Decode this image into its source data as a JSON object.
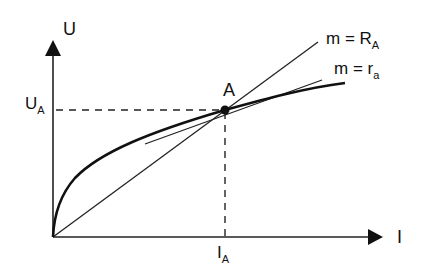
{
  "diagram": {
    "y_axis_label": "U",
    "x_axis_label": "I",
    "point_label": "A",
    "ua_label": {
      "main": "U",
      "sub": "A"
    },
    "ia_label": {
      "main": "I",
      "sub": "A"
    },
    "secant_label": {
      "prefix": "m = R",
      "sub": "A"
    },
    "tangent_label": {
      "prefix": "m = r",
      "sub": "a"
    },
    "colors": {
      "ink": "#111111",
      "background": "#ffffff"
    }
  }
}
